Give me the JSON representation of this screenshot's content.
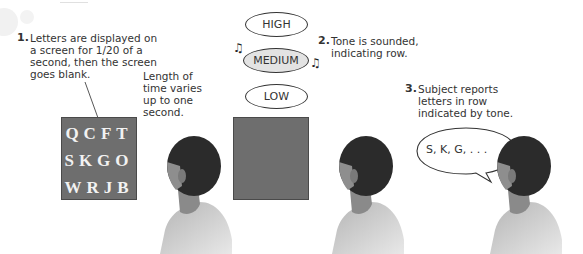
{
  "diagram": {
    "steps": [
      {
        "number": "1.",
        "text": "Letters are displayed on\na screen for 1/20 of a\nsecond, then the screen\ngoes blank."
      },
      {
        "number": "2.",
        "text": "Tone is sounded,\nindicating row."
      },
      {
        "number": "3.",
        "text": "Subject reports\nletters in row\nindicated by tone."
      }
    ],
    "delay_note": "Length of\ntime varies\nup to one\nsecond.",
    "letter_grid": {
      "rows": [
        "QCFT",
        "SKGO",
        "WRJB"
      ]
    },
    "tones": [
      {
        "label": "HIGH",
        "active": false
      },
      {
        "label": "MEDIUM",
        "active": true
      },
      {
        "label": "LOW",
        "active": false
      }
    ],
    "speech_bubble": "S, K, G, . . .",
    "icons": {
      "music_note_left": "♫",
      "music_note_right": "♫"
    },
    "colors": {
      "screen": "#6e6e6e",
      "letters": "#f2f2f2",
      "active_tone": "#e3e3e3",
      "hair": "#2b2b2b",
      "skin": "#8a8a8a",
      "shirt": "#a8a8a8"
    }
  }
}
